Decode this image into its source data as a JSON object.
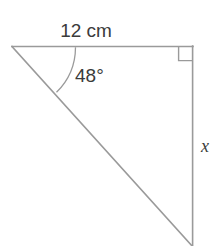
{
  "figure": {
    "type": "right-triangle-diagram",
    "title": "",
    "background_color": "#ffffff",
    "line_color": "#9a9a9a",
    "text_color": "#3b3b3b",
    "labels": {
      "top_side": "12 cm",
      "angle": "48°",
      "right_side": "x"
    },
    "icons": {
      "right_angle_marker": "right-angle-square",
      "angle_arc": "angle-arc"
    },
    "geometry": {
      "vertices": {
        "top_left": [
          12,
          46
        ],
        "top_right": [
          193,
          46
        ],
        "bottom_right": [
          193,
          246
        ]
      },
      "known_side_label": "12 cm",
      "known_angle_degrees": 48,
      "unknown_side_label": "x",
      "right_angle_at": "top_right"
    }
  }
}
